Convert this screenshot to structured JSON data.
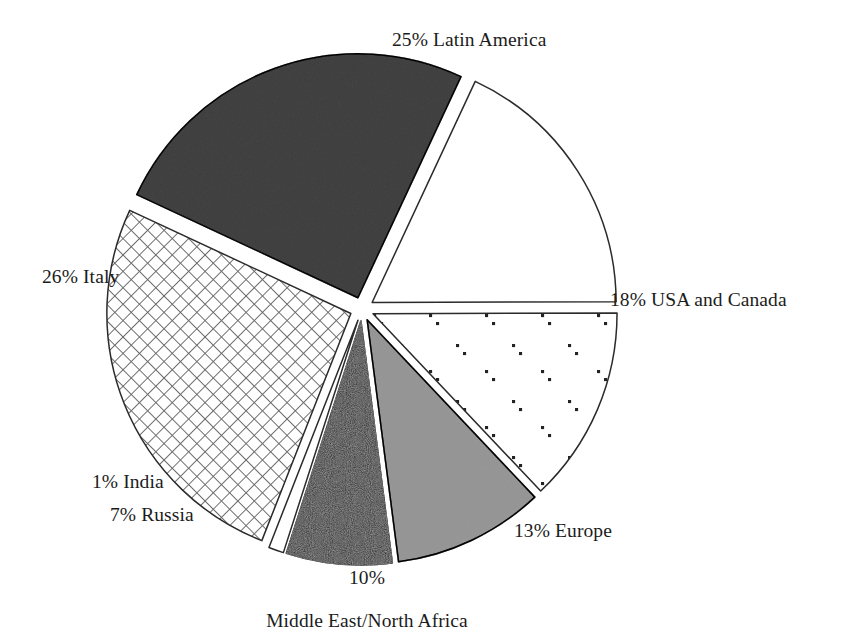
{
  "chart_data": {
    "type": "pie",
    "title": "",
    "subtitle": "",
    "xlabel": "",
    "ylabel": "",
    "grid": false,
    "legend_position": "none",
    "label_format": "{percent}% {name}",
    "total_percent": 100,
    "exploded": true,
    "start_angle_deg": -65,
    "direction": "clockwise",
    "categories": [
      "Latin America",
      "USA and Canada",
      "Europe",
      "Middle East/North Africa",
      "Russia",
      "India",
      "Italy"
    ],
    "values": [
      25,
      18,
      13,
      10,
      7,
      1,
      26
    ],
    "slices": [
      {
        "name": "Latin America",
        "value": 25,
        "percent_text": "25%",
        "label": "25% Latin America",
        "fill_style": "solid-medium-gray",
        "color": "#808080",
        "stroke": "#2b2b2b"
      },
      {
        "name": "USA and Canada",
        "value": 18,
        "percent_text": "18%",
        "label": "18% USA and Canada",
        "fill_style": "solid-white",
        "color": "#ffffff",
        "stroke": "#2b2b2b"
      },
      {
        "name": "Europe",
        "value": 13,
        "percent_text": "13%",
        "label": "13% Europe",
        "fill_style": "sparse-dots",
        "color": "#ffffff",
        "stroke": "#2b2b2b"
      },
      {
        "name": "Middle East/North Africa",
        "value": 10,
        "percent_text": "10%",
        "label": "10% Middle East/North Africa",
        "label_line_1": "10%",
        "label_line_2": "Middle East/North Africa",
        "fill_style": "solid-light-gray",
        "color": "#c4c4c4",
        "stroke": "#2b2b2b"
      },
      {
        "name": "Russia",
        "value": 7,
        "percent_text": "7%",
        "label": "7% Russia",
        "fill_style": "solid-black",
        "color": "#1a1a1a",
        "stroke": "#1a1a1a"
      },
      {
        "name": "India",
        "value": 1,
        "percent_text": "1%",
        "label": "1% India",
        "fill_style": "solid-white",
        "color": "#ffffff",
        "stroke": "#2b2b2b"
      },
      {
        "name": "Italy",
        "value": 26,
        "percent_text": "26%",
        "label": "26% Italy",
        "fill_style": "diamond-crosshatch",
        "color": "#ffffff",
        "stroke": "#2b2b2b"
      }
    ]
  },
  "labels": {
    "latin_america": "25% Latin America",
    "usa_canada": "18% USA and Canada",
    "europe": "13% Europe",
    "mena_percent": "10%",
    "mena_name": "Middle East/North Africa",
    "russia": "7% Russia",
    "india": "1% India",
    "italy": "26% Italy"
  },
  "colors": {
    "latin_america": "#808080",
    "mena": "#c4c4c4",
    "russia": "#1a1a1a",
    "outline": "#2b2b2b",
    "background": "#ffffff",
    "text": "#1b1b1b"
  }
}
